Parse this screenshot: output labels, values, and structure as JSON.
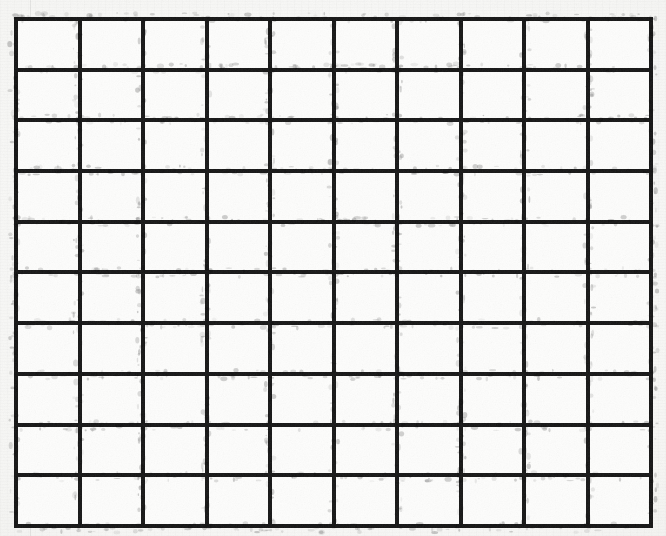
{
  "document": {
    "type": "scanned-grid-sheet",
    "title": "Blank ruled grid",
    "description": "A scanned sheet of paper showing an empty rectangular grid of heavy black rules with no text or labels."
  },
  "canvas": {
    "width": 666,
    "height": 536,
    "paper_color": "#f5f5f3",
    "cell_color": "#fdfdfc",
    "ink_color": "#161616"
  },
  "grid": {
    "columns": 10,
    "rows": 10,
    "line_width_px": 8,
    "bounds": {
      "left": 14,
      "top": 17,
      "right": 653,
      "bottom": 528,
      "width": 639,
      "height": 511
    },
    "cell_width_px": 64,
    "cell_height_px": 51,
    "cells_total": 100,
    "cell_contents": [
      [
        "",
        "",
        "",
        "",
        "",
        "",
        "",
        "",
        "",
        ""
      ],
      [
        "",
        "",
        "",
        "",
        "",
        "",
        "",
        "",
        "",
        ""
      ],
      [
        "",
        "",
        "",
        "",
        "",
        "",
        "",
        "",
        "",
        ""
      ],
      [
        "",
        "",
        "",
        "",
        "",
        "",
        "",
        "",
        "",
        ""
      ],
      [
        "",
        "",
        "",
        "",
        "",
        "",
        "",
        "",
        "",
        ""
      ],
      [
        "",
        "",
        "",
        "",
        "",
        "",
        "",
        "",
        "",
        ""
      ],
      [
        "",
        "",
        "",
        "",
        "",
        "",
        "",
        "",
        "",
        ""
      ],
      [
        "",
        "",
        "",
        "",
        "",
        "",
        "",
        "",
        "",
        ""
      ],
      [
        "",
        "",
        "",
        "",
        "",
        "",
        "",
        "",
        "",
        ""
      ],
      [
        "",
        "",
        "",
        "",
        "",
        "",
        "",
        "",
        "",
        ""
      ]
    ]
  },
  "margin_guide": {
    "x": 30,
    "color": "#00000013"
  }
}
